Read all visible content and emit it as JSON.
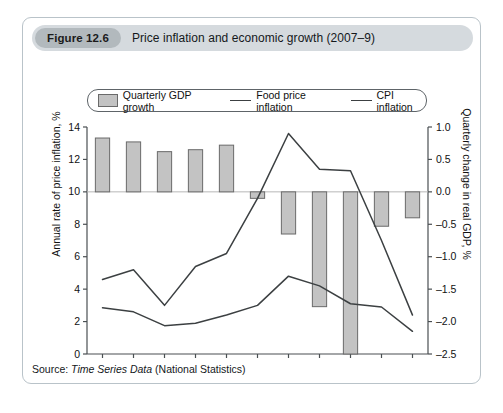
{
  "figure": {
    "badge": "Figure 12.6",
    "title": "Price inflation and economic growth (2007–9)",
    "source_prefix": "Source:",
    "source_italic": "Time Series Data",
    "source_suffix": "(National Statistics)"
  },
  "legend": {
    "bars_label": "Quarterly GDP growth",
    "food_label": "Food price inflation",
    "cpi_label": "CPI inflation"
  },
  "axes": {
    "left_title": "Annual rate of price inflation, %",
    "right_title": "Quarterly change in real GDP, %",
    "left_ticks": [
      "14",
      "12",
      "10",
      "8",
      "6",
      "4",
      "2",
      "0"
    ],
    "right_ticks": [
      "1.0",
      "0.5",
      "0.0",
      "–0.5",
      "–1.0",
      "–1.5",
      "–2.0",
      "–2.5"
    ],
    "x_ticks": [
      "2007Q1",
      "2007Q3",
      "2008Q1",
      "2008Q3",
      "2009Q1",
      "2009Q3"
    ]
  },
  "colors": {
    "bar_fill": "#c3c3c3",
    "bar_stroke": "#6a6a6a",
    "line": "#3c4042",
    "axis": "#4a4f52",
    "card_border": "#b9c3c9",
    "header_bg": "#d5dade",
    "badge_bg": "#b2b9bd"
  },
  "chart_data": {
    "type": "bar",
    "title": "Price inflation and economic growth (2007–9)",
    "xlabel": "",
    "ylabel": "Annual rate of price inflation, %",
    "y2label": "Quarterly change in real GDP, %",
    "ylim": [
      0,
      14
    ],
    "y2lim": [
      -2.5,
      1.0
    ],
    "grid": false,
    "legend_position": "top",
    "categories": [
      "2007Q1",
      "2007Q2",
      "2007Q3",
      "2007Q4",
      "2008Q1",
      "2008Q2",
      "2008Q3",
      "2008Q4",
      "2009Q1",
      "2009Q2",
      "2009Q3"
    ],
    "series": [
      {
        "name": "Quarterly GDP growth",
        "type": "bar",
        "axis": "right",
        "values": [
          0.83,
          0.77,
          0.62,
          0.65,
          0.72,
          -0.1,
          -0.65,
          -1.77,
          -2.5,
          -0.53,
          -0.4
        ]
      },
      {
        "name": "Food price inflation",
        "type": "line",
        "axis": "left",
        "values": [
          4.6,
          5.2,
          3.0,
          5.4,
          6.2,
          9.6,
          13.6,
          11.4,
          11.3,
          7.0,
          2.4
        ]
      },
      {
        "name": "CPI inflation",
        "type": "line",
        "axis": "left",
        "values": [
          2.85,
          2.6,
          1.75,
          1.9,
          2.4,
          3.0,
          4.8,
          4.2,
          3.1,
          2.9,
          1.4
        ]
      }
    ]
  }
}
